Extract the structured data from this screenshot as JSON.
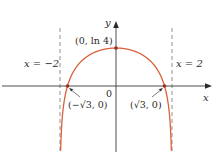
{
  "chart_data": {
    "type": "line",
    "title": "",
    "function": "y = ln(4 - x^2)",
    "xlabel": "x",
    "ylabel": "y",
    "origin_label": "0",
    "xlim": [
      -2.0,
      2.0
    ],
    "series": [
      {
        "name": "y = ln(4 - x^2)",
        "color": "#d9603b",
        "x": [
          -1.995,
          -1.98,
          -1.95,
          -1.9,
          -1.8,
          -1.732,
          -1.6,
          -1.4,
          -1.2,
          -1.0,
          -0.8,
          -0.6,
          -0.4,
          -0.2,
          0.0,
          0.2,
          0.4,
          0.6,
          0.8,
          1.0,
          1.2,
          1.4,
          1.6,
          1.732,
          1.8,
          1.9,
          1.95,
          1.98,
          1.995
        ],
        "values": [
          -2.3,
          -1.39,
          -0.69,
          -0.05,
          0.42,
          0.0,
          0.36,
          0.71,
          0.94,
          1.1,
          1.21,
          1.29,
          1.35,
          1.38,
          1.386,
          1.38,
          1.35,
          1.29,
          1.21,
          1.1,
          0.94,
          0.71,
          0.36,
          0.0,
          -0.28,
          -0.05,
          -0.69,
          -1.39,
          -2.3
        ]
      }
    ],
    "asymptotes": [
      {
        "x": -2,
        "label": "x = −2",
        "style": "dashed",
        "color": "#b0b0b0"
      },
      {
        "x": 2,
        "label": "x = 2",
        "style": "dashed",
        "color": "#b0b0b0"
      }
    ],
    "points": [
      {
        "x": 0,
        "y": 1.386,
        "label": "(0, ln 4)"
      },
      {
        "x": -1.732,
        "y": 0,
        "label": "(−√3, 0)"
      },
      {
        "x": 1.732,
        "y": 0,
        "label": "(√3, 0)"
      }
    ],
    "grid": false,
    "legend": "none"
  },
  "labels": {
    "y_axis": "y",
    "x_axis": "x",
    "origin": "0",
    "peak": "(0, ln 4)",
    "left_asymptote": "x = −2",
    "right_asymptote": "x = 2",
    "left_intercept": "(−√3, 0)",
    "right_intercept": "(√3, 0)"
  },
  "colors": {
    "curve": "#d9603b",
    "asymptote": "#b0b0b0",
    "axis": "#3a3a3a",
    "point": "#9a2e1a"
  }
}
